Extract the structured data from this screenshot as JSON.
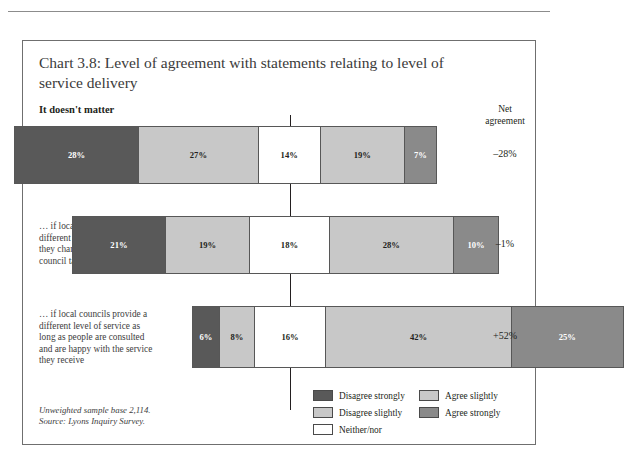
{
  "page": {
    "running_header": ""
  },
  "chart_frame": {
    "title": "Chart 3.8: Level of agreement with statements relating to level of service delivery",
    "subhead": "It doesn't matter",
    "net_header_line1": "Net",
    "net_header_line2": "agreement",
    "footnote_line1": "Unweighted sample base 2,114.",
    "footnote_line2": "Source: Lyons Inquiry Survey."
  },
  "legend": {
    "left_column": [
      {
        "label": "Disagree strongly",
        "color": "#595959"
      },
      {
        "label": "Disagree slightly",
        "color": "#c8c8c8"
      },
      {
        "label": "Neither/nor",
        "color": "#ffffff"
      }
    ],
    "right_column": [
      {
        "label": "Agree slightly",
        "color": "#c8c8c8"
      },
      {
        "label": "Agree strongly",
        "color": "#8a8a8a"
      }
    ]
  },
  "chart_data": {
    "type": "bar",
    "orientation": "horizontal",
    "stacked": true,
    "diverging": true,
    "title": "Chart 3.8: Level of agreement with statements relating to level of service delivery",
    "subtitle": "It doesn't matter",
    "xlabel": "",
    "ylabel": "",
    "grid": false,
    "legend_position": "bottom-right",
    "categories": [
      "… if local levels of service are not the same in different areas of the country",
      "… if local councils provide different levels of service if they charge different levels of council tax",
      "… if local councils provide a different level of service as long as people are consulted and are happy with the service they receive"
    ],
    "series": [
      {
        "name": "Disagree strongly",
        "color": "#595959",
        "values": [
          28,
          21,
          6
        ]
      },
      {
        "name": "Disagree slightly",
        "color": "#c8c8c8",
        "values": [
          27,
          19,
          8
        ]
      },
      {
        "name": "Neither/nor",
        "color": "#ffffff",
        "values": [
          14,
          18,
          16
        ]
      },
      {
        "name": "Agree slightly",
        "color": "#c8c8c8",
        "values": [
          19,
          28,
          42
        ]
      },
      {
        "name": "Agree strongly",
        "color": "#8a8a8a",
        "values": [
          7,
          10,
          25
        ]
      }
    ],
    "value_labels": [
      [
        "28%",
        "27%",
        "14%",
        "19%",
        "7%"
      ],
      [
        "21%",
        "19%",
        "18%",
        "28%",
        "10%"
      ],
      [
        "6%",
        "8%",
        "16%",
        "42%",
        "25%"
      ]
    ],
    "net_agreement": [
      "–28%",
      "–1%",
      "+52%"
    ],
    "units": "percent"
  },
  "rows": [
    {
      "label": "… if local levels of service are not the same in different areas of the country",
      "net": "–28%",
      "segments": [
        {
          "name": "Disagree strongly",
          "value": 28,
          "label": "28%",
          "color": "#595959",
          "text": "#ffffff"
        },
        {
          "name": "Disagree slightly",
          "value": 27,
          "label": "27%",
          "color": "#c8c8c8",
          "text": "#231f20"
        },
        {
          "name": "Neither/nor",
          "value": 14,
          "label": "14%",
          "color": "#ffffff",
          "text": "#231f20"
        },
        {
          "name": "Agree slightly",
          "value": 19,
          "label": "19%",
          "color": "#c8c8c8",
          "text": "#231f20"
        },
        {
          "name": "Agree strongly",
          "value": 7,
          "label": "7%",
          "color": "#8a8a8a",
          "text": "#ffffff"
        }
      ]
    },
    {
      "label": "… if local councils provide different levels of service if they charge different levels of council tax",
      "net": "–1%",
      "segments": [
        {
          "name": "Disagree strongly",
          "value": 21,
          "label": "21%",
          "color": "#595959",
          "text": "#ffffff"
        },
        {
          "name": "Disagree slightly",
          "value": 19,
          "label": "19%",
          "color": "#c8c8c8",
          "text": "#231f20"
        },
        {
          "name": "Neither/nor",
          "value": 18,
          "label": "18%",
          "color": "#ffffff",
          "text": "#231f20"
        },
        {
          "name": "Agree slightly",
          "value": 28,
          "label": "28%",
          "color": "#c8c8c8",
          "text": "#231f20"
        },
        {
          "name": "Agree strongly",
          "value": 10,
          "label": "10%",
          "color": "#8a8a8a",
          "text": "#ffffff"
        }
      ]
    },
    {
      "label": "… if local councils provide a different level of service as long as people are consulted and are happy with the service they receive",
      "net": "+52%",
      "segments": [
        {
          "name": "Disagree strongly",
          "value": 6,
          "label": "6%",
          "color": "#595959",
          "text": "#ffffff"
        },
        {
          "name": "Disagree slightly",
          "value": 8,
          "label": "8%",
          "color": "#c8c8c8",
          "text": "#231f20"
        },
        {
          "name": "Neither/nor",
          "value": 16,
          "label": "16%",
          "color": "#ffffff",
          "text": "#231f20"
        },
        {
          "name": "Agree slightly",
          "value": 42,
          "label": "42%",
          "color": "#c8c8c8",
          "text": "#231f20"
        },
        {
          "name": "Agree strongly",
          "value": 25,
          "label": "25%",
          "color": "#8a8a8a",
          "text": "#ffffff"
        }
      ]
    }
  ]
}
